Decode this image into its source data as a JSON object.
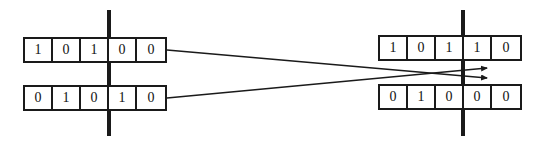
{
  "diagram": {
    "ink_color": "#1a1a1a",
    "background_color": "#ffffff",
    "parents": [
      {
        "name": "parent-a",
        "genes": [
          "1",
          "0",
          "1",
          "0",
          "0"
        ]
      },
      {
        "name": "parent-b",
        "genes": [
          "0",
          "1",
          "0",
          "1",
          "0"
        ]
      }
    ],
    "offspring": [
      {
        "name": "offspring-a",
        "genes": [
          "1",
          "0",
          "1",
          "1",
          "0"
        ]
      },
      {
        "name": "offspring-b",
        "genes": [
          "0",
          "1",
          "0",
          "0",
          "0"
        ]
      }
    ],
    "crossover_point": {
      "gene_index": 3,
      "left_marker_x": 107,
      "right_marker_x": 461
    },
    "connectors": [
      {
        "name": "parent-a-to-offspring-b",
        "from": [
          167,
          50
        ],
        "to": [
          488,
          78
        ]
      },
      {
        "name": "parent-b-to-offspring-a",
        "from": [
          167,
          98
        ],
        "to": [
          488,
          68
        ]
      }
    ]
  }
}
